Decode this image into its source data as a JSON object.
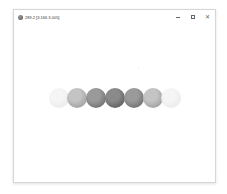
{
  "window": {
    "title": "289.2 [3.166 3.005]",
    "app_icon": "sphere-app-icon",
    "controls": {
      "minimize_icon": "minimize-icon",
      "maximize_icon": "maximize-icon",
      "close_glyph": "✕"
    }
  },
  "canvas": {
    "background": "#ffffff",
    "spheres": [
      {
        "x": 35,
        "y": 78,
        "base": "#f4f4f4",
        "shade": "#e2e2e2",
        "opacity": 0.9
      },
      {
        "x": 53,
        "y": 78,
        "base": "#c4c4c4",
        "shade": "#8e8e8e",
        "opacity": 1
      },
      {
        "x": 72,
        "y": 78,
        "base": "#9a9a9a",
        "shade": "#5c5c5c",
        "opacity": 1
      },
      {
        "x": 91,
        "y": 78,
        "base": "#8a8a8a",
        "shade": "#4a4a4a",
        "opacity": 1
      },
      {
        "x": 110,
        "y": 78,
        "base": "#9a9a9a",
        "shade": "#5c5c5c",
        "opacity": 1
      },
      {
        "x": 129,
        "y": 78,
        "base": "#c4c4c4",
        "shade": "#8e8e8e",
        "opacity": 1
      },
      {
        "x": 147,
        "y": 78,
        "base": "#f4f4f4",
        "shade": "#e2e2e2",
        "opacity": 0.9
      }
    ]
  }
}
